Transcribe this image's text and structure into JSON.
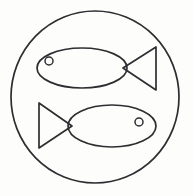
{
  "figure": {
    "title": "Two fish in a circle",
    "background_color": "#fdfdfc",
    "stroke_color": "#2e2e32",
    "canvas": {
      "width": 193,
      "height": 196
    }
  },
  "outer_circle": {
    "name": "outer circle",
    "cx": 95,
    "cy": 97,
    "rx": 84,
    "ry": 86,
    "stroke_width": 1.7
  },
  "fish": [
    {
      "id": "top-fish",
      "label": "Upper fish facing left",
      "direction": "left",
      "body": {
        "cx": 82,
        "cy": 68,
        "rx": 45,
        "ry": 20
      },
      "tail": {
        "points": "123,68 156,47 156,90",
        "tip_x": 123,
        "tip_y": 68
      },
      "eye": {
        "cx": 49,
        "cy": 61,
        "r": 4
      }
    },
    {
      "id": "bottom-fish",
      "label": "Lower fish facing right",
      "direction": "right",
      "body": {
        "cx": 112,
        "cy": 126,
        "rx": 44,
        "ry": 21
      },
      "tail": {
        "points": "72,126 39,103 39,148",
        "tip_x": 72,
        "tip_y": 126
      },
      "eye": {
        "cx": 139,
        "cy": 122,
        "r": 4
      }
    }
  ]
}
